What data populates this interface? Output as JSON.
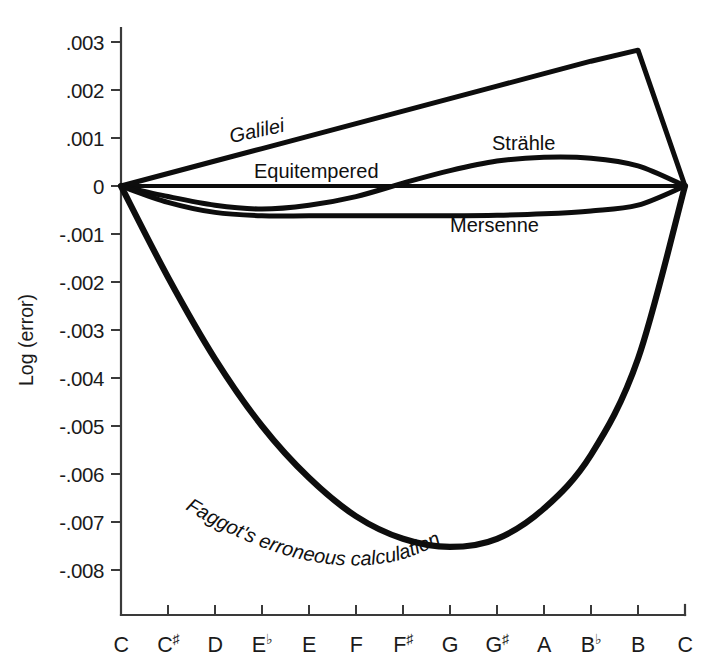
{
  "chart_data": {
    "type": "line",
    "title": "",
    "xlabel": "",
    "ylabel": "Log (error)",
    "x_tick_labels": [
      "C",
      "C#",
      "D",
      "Eb",
      "E",
      "F",
      "F#",
      "G",
      "G#",
      "A",
      "Bb",
      "B",
      "C"
    ],
    "x_note_bases": [
      "C",
      "C",
      "D",
      "E",
      "E",
      "F",
      "F",
      "G",
      "G",
      "A",
      "B",
      "B",
      "C"
    ],
    "x_accidentals": [
      "",
      "♯",
      "",
      "♭",
      "",
      "",
      "♯",
      "",
      "♯",
      "",
      "♭",
      "",
      ""
    ],
    "y_tick_labels": [
      ".003",
      ".002",
      ".001",
      "0",
      "-.001",
      "-.002",
      "-.003",
      "-.004",
      "-.005",
      "-.006",
      "-.007",
      "-.008"
    ],
    "y_tick_values": [
      0.003,
      0.002,
      0.001,
      0,
      -0.001,
      -0.002,
      -0.003,
      -0.004,
      -0.005,
      -0.006,
      -0.007,
      -0.008
    ],
    "ylim": [
      -0.0089,
      0.0033
    ],
    "xlim": [
      0,
      12
    ],
    "grid": false,
    "legend": "inline-curve-labels",
    "series": [
      {
        "name": "Galilei",
        "label": "Galilei",
        "label_style": "italic-rotated",
        "values": [
          0.0,
          0.00026,
          0.00052,
          0.00078,
          0.00104,
          0.0013,
          0.00156,
          0.00182,
          0.00208,
          0.00234,
          0.0026,
          0.00283,
          0.0
        ]
      },
      {
        "name": "Equitempered",
        "label": "Equitempered",
        "label_style": "upright",
        "values": [
          0.0,
          0.0,
          0.0,
          0.0,
          0.0,
          0.0,
          0.0,
          0.0,
          0.0,
          0.0,
          0.0,
          0.0,
          0.0
        ]
      },
      {
        "name": "Strahle",
        "label": "Strähle",
        "label_style": "upright",
        "values": [
          0.0,
          -0.00022,
          -0.0004,
          -0.00048,
          -0.0004,
          -0.00022,
          6e-05,
          0.00032,
          0.00052,
          0.0006,
          0.00058,
          0.00042,
          0.0
        ]
      },
      {
        "name": "Mersenne",
        "label": "Mersenne",
        "label_style": "upright",
        "values": [
          0.0,
          -0.00034,
          -0.00055,
          -0.00062,
          -0.00062,
          -0.00062,
          -0.00062,
          -0.00062,
          -0.00061,
          -0.00058,
          -0.00052,
          -0.0004,
          0.0
        ]
      },
      {
        "name": "Faggot",
        "label": "Faggot's erroneous calculation",
        "label_style": "italic-curved",
        "values": [
          0.0,
          -0.0019,
          -0.0036,
          -0.005,
          -0.00608,
          -0.00688,
          -0.00735,
          -0.00752,
          -0.00735,
          -0.00672,
          -0.0056,
          -0.0036,
          0.0
        ]
      }
    ]
  },
  "labels": {
    "galilei": "Galilei",
    "equitempered": "Equitempered",
    "strahle": "Strähle",
    "mersenne": "Mersenne",
    "faggot": "Faggot's erroneous calculation",
    "faggot_part1": "Faggot's erroneou",
    "faggot_part2": "s calculation",
    "y_axis_title": "Log (error)"
  }
}
